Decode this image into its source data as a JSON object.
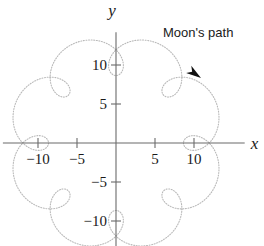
{
  "figure": {
    "background_color": "#ffffff",
    "annotation": {
      "text": "Moon's path",
      "x_px": 163,
      "y_px": 26
    },
    "arrow": {
      "name": "direction-arrowhead",
      "color": "#111111",
      "tip_x_px": 201,
      "tip_y_px": 78,
      "angle_deg": 35
    }
  },
  "axes": {
    "x_axis_label": "x",
    "y_axis_label": "y",
    "axis_color": "#6b6b6b",
    "origin_px": {
      "x": 116,
      "y": 143
    },
    "pixels_per_unit": 7.8,
    "xlim": [
      -14.5,
      16.5
    ],
    "ylim": [
      -13.2,
      14.2
    ],
    "x_ticks": [
      {
        "value": -10,
        "label": "−10"
      },
      {
        "value": -5,
        "label": "−5"
      },
      {
        "value": 5,
        "label": "5"
      },
      {
        "value": 10,
        "label": "10"
      }
    ],
    "y_ticks": [
      {
        "value": 10,
        "label": "10"
      },
      {
        "value": 5,
        "label": "5"
      },
      {
        "value": -5,
        "label": "−5"
      },
      {
        "value": -10,
        "label": "−10"
      }
    ]
  },
  "chart_data": {
    "type": "line",
    "title": "",
    "subtitle": "",
    "xlabel": "x",
    "ylabel": "y",
    "grid": false,
    "legend": "none",
    "annotations": [
      {
        "text": "Moon's path",
        "x": 6.0,
        "y": 13.3
      }
    ],
    "series": [
      {
        "name": "Moon's path",
        "curve_type": "epitrochoid",
        "color": "#b9b9b9",
        "linestyle": "dotted",
        "linewidth": 1.1,
        "parameters": {
          "R": 10.0,
          "r": 1.25,
          "d": 2.6,
          "loops": 8
        },
        "equation_x": "(R + r) * cos(t) - d * cos(((R + r) / r) * t)",
        "equation_y": "(R + r) * sin(t) - d * sin(((R + r) / r) * t)",
        "t_range_deg": [
          0,
          360
        ],
        "samples": 720,
        "xlim": [
          -12.1,
          12.1
        ],
        "ylim": [
          -12.1,
          12.1
        ]
      }
    ]
  }
}
